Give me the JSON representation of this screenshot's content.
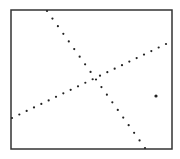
{
  "figure": {
    "frame": {
      "x": 11,
      "y": 10,
      "width": 161,
      "height": 139,
      "stroke": "#333333",
      "stroke_width": 1.5
    },
    "dot_color": "#222222",
    "dot_radius": 1.1,
    "lines": [
      {
        "name": "steep-dotted-line",
        "start": [
          47,
          11
        ],
        "end": [
          145,
          148
        ],
        "dot_count": 19
      },
      {
        "name": "shallow-dotted-line",
        "start": [
          12,
          118
        ],
        "end": [
          166,
          44
        ],
        "dot_count": 22
      }
    ],
    "isolated_points": [
      {
        "name": "outlier-point",
        "x": 156,
        "y": 96,
        "r": 1.6
      }
    ],
    "intersection": [
      93,
      78
    ]
  }
}
